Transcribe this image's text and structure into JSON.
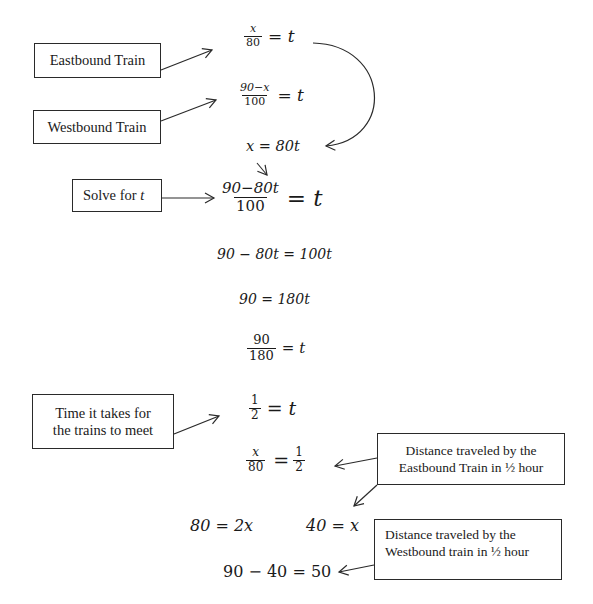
{
  "labels": {
    "eastbound": "Eastbound Train",
    "westbound": "Westbound Train",
    "solve_prefix": "Solve for ",
    "solve_var": "t",
    "time_line1": "Time it takes for",
    "time_line2": "the trains to meet",
    "dist_east_line1": "Distance traveled by the",
    "dist_east_line2": "Eastbound Train in ½ hour",
    "dist_west_line1": "Distance traveled by the",
    "dist_west_line2": "Westbound train in ½ hour"
  },
  "equations": {
    "eq1": {
      "num": "x",
      "den": "80",
      "rhs": "= t"
    },
    "eq2": {
      "num": "90−x",
      "den": "100",
      "rhs": "= t"
    },
    "eq3": {
      "text_lhs": "x",
      "text_rhs": " = 80t"
    },
    "eq4": {
      "num": "90−80t",
      "den": "100",
      "rhs": "= t"
    },
    "eq5": {
      "text": "90 − 80t = 100t"
    },
    "eq6": {
      "text": "90 = 180t"
    },
    "eq7": {
      "num": "90",
      "den": "180",
      "rhs": "= t"
    },
    "eq8": {
      "num": "1",
      "den": "2",
      "rhs": "= t"
    },
    "eq9": {
      "num": "x",
      "den": "80",
      "eq": "=",
      "num2": "1",
      "den2": "2"
    },
    "eq10": {
      "text": "80 = 2x"
    },
    "eq11": {
      "text": "40 = x"
    },
    "eq12": {
      "text": "90 − 40 = 50"
    }
  },
  "colors": {
    "ink": "#1a1a1a",
    "box_border": "#2a2a2a",
    "background": "#ffffff"
  }
}
